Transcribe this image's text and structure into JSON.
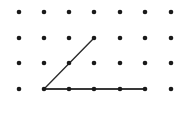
{
  "figure": {
    "background_color": "#ffffff",
    "width": 183,
    "height": 114
  },
  "grid": {
    "name": "dot-array",
    "columns": 7,
    "rows": 4,
    "origin_x": 19,
    "origin_y": 12,
    "spacing_x": 25.3,
    "spacing_y": 25.7,
    "dot_color": "#1a1a1a",
    "dot_radius": 2.3,
    "points": [
      {
        "col": 1,
        "row": 1,
        "x": 19,
        "y": 12
      },
      {
        "col": 2,
        "row": 1,
        "x": 44,
        "y": 12
      },
      {
        "col": 3,
        "row": 1,
        "x": 69,
        "y": 12
      },
      {
        "col": 4,
        "row": 1,
        "x": 94,
        "y": 12
      },
      {
        "col": 5,
        "row": 1,
        "x": 120,
        "y": 12
      },
      {
        "col": 6,
        "row": 1,
        "x": 145,
        "y": 12
      },
      {
        "col": 7,
        "row": 1,
        "x": 171,
        "y": 12
      },
      {
        "col": 1,
        "row": 2,
        "x": 19,
        "y": 38
      },
      {
        "col": 2,
        "row": 2,
        "x": 44,
        "y": 38
      },
      {
        "col": 3,
        "row": 2,
        "x": 69,
        "y": 38
      },
      {
        "col": 4,
        "row": 2,
        "x": 94,
        "y": 38
      },
      {
        "col": 5,
        "row": 2,
        "x": 120,
        "y": 38
      },
      {
        "col": 6,
        "row": 2,
        "x": 145,
        "y": 38
      },
      {
        "col": 7,
        "row": 2,
        "x": 171,
        "y": 38
      },
      {
        "col": 1,
        "row": 3,
        "x": 19,
        "y": 63
      },
      {
        "col": 2,
        "row": 3,
        "x": 44,
        "y": 63
      },
      {
        "col": 3,
        "row": 3,
        "x": 69,
        "y": 63
      },
      {
        "col": 4,
        "row": 3,
        "x": 94,
        "y": 63
      },
      {
        "col": 5,
        "row": 3,
        "x": 120,
        "y": 63
      },
      {
        "col": 6,
        "row": 3,
        "x": 145,
        "y": 63
      },
      {
        "col": 7,
        "row": 3,
        "x": 171,
        "y": 63
      },
      {
        "col": 1,
        "row": 4,
        "x": 19,
        "y": 89
      },
      {
        "col": 2,
        "row": 4,
        "x": 44,
        "y": 89
      },
      {
        "col": 3,
        "row": 4,
        "x": 69,
        "y": 89
      },
      {
        "col": 4,
        "row": 4,
        "x": 94,
        "y": 89
      },
      {
        "col": 5,
        "row": 4,
        "x": 120,
        "y": 89
      },
      {
        "col": 6,
        "row": 4,
        "x": 145,
        "y": 89
      },
      {
        "col": 7,
        "row": 4,
        "x": 171,
        "y": 89
      }
    ]
  },
  "shape": {
    "name": "triangle",
    "type": "polygon",
    "stroke_color": "#2b2b2b",
    "stroke_width": 1.4,
    "fill": "none",
    "vertices": [
      {
        "label": "apex",
        "col": 4,
        "row": 2,
        "x": 94,
        "y": 38
      },
      {
        "label": "bottom-left",
        "col": 2,
        "row": 4,
        "x": 44,
        "y": 89
      },
      {
        "label": "bottom-right",
        "col": 6,
        "row": 4,
        "x": 145,
        "y": 89
      }
    ],
    "points_attr": "94,38 44,89 145,89",
    "edges": [
      {
        "name": "left-leg",
        "from": "apex",
        "to": "bottom-left"
      },
      {
        "name": "base",
        "from": "bottom-left",
        "to": "bottom-right"
      },
      {
        "name": "right-leg",
        "from": "bottom-right",
        "to": "apex"
      }
    ]
  },
  "chart_data": {
    "type": "scatter",
    "xlabel": "",
    "ylabel": "",
    "xlim": [
      1,
      7
    ],
    "ylim": [
      1,
      4
    ],
    "grid": false,
    "legend": "none",
    "series": [
      {
        "name": "grid-dots",
        "x": [
          1,
          2,
          3,
          4,
          5,
          6,
          7,
          1,
          2,
          3,
          4,
          5,
          6,
          7,
          1,
          2,
          3,
          4,
          5,
          6,
          7,
          1,
          2,
          3,
          4,
          5,
          6,
          7
        ],
        "y": [
          4,
          4,
          4,
          4,
          4,
          4,
          4,
          3,
          3,
          3,
          3,
          3,
          3,
          3,
          2,
          2,
          2,
          2,
          2,
          2,
          2,
          1,
          1,
          1,
          1,
          1,
          1,
          1
        ]
      },
      {
        "name": "triangle-outline",
        "x": [
          4,
          2,
          6,
          4
        ],
        "y": [
          3,
          1,
          1,
          3
        ]
      }
    ],
    "annotations": [
      "Apex at grid column 4, row 2 (from top)",
      "Base spans grid columns 2 through 6 on row 4 (bottom)",
      "Left leg passes through the dot at column 3, row 3",
      "Right leg passes through the dot at column 5, row 3",
      "Three interior base dots at columns 3, 4 and 5 lie on the base",
      "Dot at column 4, row 3 lies inside the triangle"
    ]
  }
}
